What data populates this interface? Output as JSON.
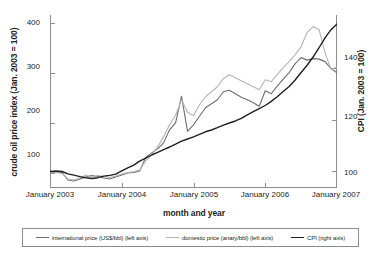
{
  "chart_data": {
    "type": "line",
    "title": "",
    "xlabel": "month and year",
    "ylabel": "crude oil price index (Jan. 2003 = 100)",
    "ylabel_right": "CPI (Jan. 2003 = 100)",
    "xlim": [
      "January 2003",
      "January 2007"
    ],
    "ylim": [
      70,
      415
    ],
    "ylim_right": [
      93.6,
      160.7
    ],
    "yticks": [
      100,
      200,
      300,
      400
    ],
    "yticks_right": [
      100,
      120,
      140
    ],
    "xticks": [
      "January 2003",
      "January 2004",
      "January 2005",
      "January 2006",
      "January 2007"
    ],
    "grid": false,
    "legend_position": "bottom",
    "x_months": [
      "2003-01",
      "2003-02",
      "2003-03",
      "2003-04",
      "2003-05",
      "2003-06",
      "2003-07",
      "2003-08",
      "2003-09",
      "2003-10",
      "2003-11",
      "2003-12",
      "2004-01",
      "2004-02",
      "2004-03",
      "2004-04",
      "2004-05",
      "2004-06",
      "2004-07",
      "2004-08",
      "2004-09",
      "2004-10",
      "2004-11",
      "2004-12",
      "2005-01",
      "2005-02",
      "2005-03",
      "2005-04",
      "2005-05",
      "2005-06",
      "2005-07",
      "2005-08",
      "2005-09",
      "2005-10",
      "2005-11",
      "2005-12",
      "2006-01",
      "2006-02",
      "2006-03",
      "2006-04",
      "2006-05",
      "2006-06",
      "2006-07",
      "2006-08",
      "2006-09",
      "2006-10",
      "2006-11",
      "2006-12",
      "2007-01"
    ],
    "series": [
      {
        "name": "international price (US$/bbl) (left axis)",
        "axis": "left",
        "color": "#6e6e6e",
        "width": 1.1,
        "values": [
          100,
          102,
          101,
          86,
          84,
          88,
          92,
          95,
          93,
          90,
          88,
          92,
          96,
          100,
          101,
          104,
          131,
          140,
          148,
          160,
          186,
          200,
          253,
          183,
          196,
          213,
          230,
          238,
          246,
          262,
          265,
          258,
          251,
          246,
          240,
          233,
          264,
          258,
          273,
          287,
          300,
          318,
          330,
          325,
          328,
          327,
          322,
          308,
          300
        ]
      },
      {
        "name": "domestic price (anary/bbl) (left axis)",
        "axis": "left",
        "color": "#b5b5b5",
        "width": 1.1,
        "values": [
          100,
          101,
          99,
          88,
          86,
          90,
          96,
          92,
          95,
          93,
          91,
          94,
          98,
          101,
          103,
          106,
          124,
          136,
          152,
          172,
          196,
          215,
          246,
          221,
          214,
          236,
          252,
          262,
          272,
          288,
          296,
          290,
          284,
          278,
          272,
          266,
          286,
          282,
          296,
          310,
          322,
          336,
          352,
          380,
          392,
          386,
          340,
          306,
          312
        ]
      },
      {
        "name": "CPI (right axis)",
        "axis": "right",
        "color": "#231f20",
        "width": 1.4,
        "values": [
          100.0,
          100.2,
          100.0,
          99.1,
          98.6,
          98.0,
          97.6,
          97.3,
          97.6,
          98.2,
          98.5,
          99.0,
          100.2,
          101.4,
          102.5,
          104.0,
          105.2,
          106.4,
          107.4,
          108.5,
          109.5,
          110.6,
          111.8,
          112.6,
          113.4,
          114.4,
          115.4,
          116.1,
          117.0,
          118.0,
          118.8,
          119.6,
          120.6,
          122.0,
          123.2,
          124.4,
          125.6,
          127.2,
          129.0,
          131.0,
          133.0,
          135.5,
          138.4,
          141.2,
          144.4,
          148.0,
          151.8,
          155.0,
          157.2
        ]
      }
    ]
  },
  "axes": {
    "left_title": "crude oil price index (Jan. 2003 = 100)",
    "right_title": "CPI (Jan. 2003 = 100)",
    "x_title": "month and year",
    "left_ticks": [
      "400",
      "300",
      "200",
      "100"
    ],
    "right_ticks": [
      "140",
      "120",
      "100"
    ],
    "x_ticks": [
      "January 2003",
      "January 2004",
      "January 2005",
      "January 2006",
      "January 2007"
    ]
  },
  "legend": {
    "entries": [
      {
        "label": "international price (US$/bbl) (left axis)",
        "color": "#6e6e6e",
        "width": 1.2
      },
      {
        "label": "domestic price (anary/bbl) (left axis)",
        "color": "#b5b5b5",
        "width": 1.2
      },
      {
        "label": "CPI (right axis)",
        "color": "#231f20",
        "width": 1.7
      }
    ]
  },
  "colors": {
    "international": "#6e6e6e",
    "domestic": "#b5b5b5",
    "cpi": "#231f20",
    "axis": "#8d8d8d",
    "text": "#231f20",
    "background": "#ffffff"
  }
}
